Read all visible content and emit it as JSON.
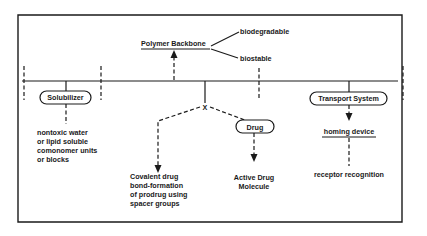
{
  "diagram": {
    "title": "",
    "backbone": {
      "label": "Polymer Backbone",
      "branches": [
        "biodegradable",
        "biostable"
      ]
    },
    "components": {
      "solubilizer": {
        "label": "Solubilizer",
        "description": [
          "nontoxic water",
          "or lipid soluble",
          "comonomer units",
          "or blocks"
        ]
      },
      "linker": {
        "label": "X",
        "description": [
          "Covalent drug",
          "bond-formation",
          "of prodrug using",
          "spacer groups"
        ]
      },
      "drug": {
        "label": "Drug",
        "description": [
          "Active Drug",
          "Molecule"
        ]
      },
      "transport": {
        "label": "Transport System",
        "homing": "homing device",
        "description": "receptor recognition"
      }
    },
    "colors": {
      "ink": "#1a1a1a",
      "background": "#ffffff"
    }
  }
}
